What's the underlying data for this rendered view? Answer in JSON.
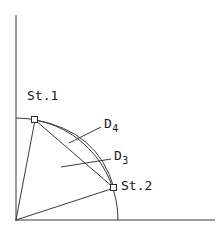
{
  "figure": {
    "title": "",
    "background_color": "#ffffff",
    "line_color": "#262626",
    "text_color": "#1a1a1a",
    "labels": {
      "station_1": "St.1",
      "station_2": "St.2",
      "distance_4_base": "D",
      "distance_4_sub": "4",
      "distance_3_base": "D",
      "distance_3_sub": "3"
    },
    "axes": {
      "origin_x": 16,
      "origin_y": 220,
      "y_axis_top": 15,
      "x_axis_right": 215
    },
    "geometry": {
      "arc_radius": 102,
      "arc_start_on_y_axis": [
        16,
        118
      ],
      "arc_end_on_x_axis": [
        118,
        220
      ],
      "station_1_point": [
        35,
        120
      ],
      "station_2_point": [
        114,
        188
      ],
      "marker_style": "open-square",
      "radial_line_1": "origin to station_1",
      "radial_line_2": "origin to station_2",
      "chord_line": "station_1 to station_2",
      "curve_d4": "arc bulging outward from station_1 to station_2",
      "leader_d4_from": [
        100,
        128
      ],
      "leader_d4_to": [
        68,
        142
      ],
      "leader_d3_from": [
        110,
        160
      ],
      "leader_d3_to": [
        62,
        168
      ]
    }
  }
}
